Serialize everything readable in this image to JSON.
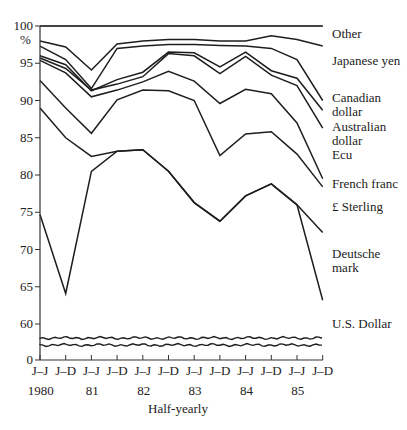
{
  "chart_data": {
    "type": "area",
    "subtype": "stacked-percentage-line",
    "title": "",
    "xlabel": "Half-yearly",
    "ylabel": "%",
    "ylim": [
      0,
      100
    ],
    "y_axis_break": {
      "from": 0,
      "to": 60
    },
    "y_ticks": [
      0,
      60,
      65,
      70,
      75,
      80,
      85,
      90,
      95,
      100
    ],
    "x_tick_labels": [
      "J–J",
      "J–D",
      "J–J",
      "J–D",
      "J–J",
      "J–D",
      "J–J",
      "J–D",
      "J–J",
      "J–D",
      "J–J",
      "J–D"
    ],
    "x_year_labels": [
      {
        "label": "1980",
        "index": 0.5
      },
      {
        "label": "81",
        "index": 2.5
      },
      {
        "label": "82",
        "index": 4.5
      },
      {
        "label": "83",
        "index": 6.5
      },
      {
        "label": "84",
        "index": 8.5
      },
      {
        "label": "85",
        "index": 10.5
      }
    ],
    "categories": [
      "1980 J–J",
      "1980 J–D",
      "1981 J–J",
      "1981 J–D",
      "1982 J–J",
      "1982 J–D",
      "1983 J–J",
      "1983 J–D",
      "1984 J–J",
      "1984 J–D",
      "1985 J–J",
      "1985 J–D"
    ],
    "legend_position": "right",
    "grid": false,
    "series_note": "Values are cumulative upper boundaries of each currency band (percent share).",
    "series": [
      {
        "name": "Other",
        "boundary": "top",
        "values": [
          100,
          100,
          100,
          100,
          100,
          100,
          100,
          100,
          100,
          100,
          100,
          100
        ]
      },
      {
        "name": "Japanese yen",
        "boundary": "top",
        "values": [
          98.0,
          97.2,
          94.1,
          97.6,
          98.0,
          98.2,
          98.2,
          98.0,
          98.0,
          98.7,
          98.2,
          97.3
        ]
      },
      {
        "name": "Canadian dollar",
        "boundary": "top",
        "values": [
          97.3,
          95.5,
          91.6,
          97.0,
          97.3,
          97.5,
          97.5,
          97.4,
          97.3,
          97.0,
          95.5,
          90.0
        ]
      },
      {
        "name": "Australian dollar",
        "boundary": "top",
        "values": [
          96.0,
          94.8,
          91.3,
          92.8,
          93.8,
          96.5,
          96.4,
          94.5,
          96.5,
          94.0,
          93.0,
          88.7
        ]
      },
      {
        "name": "Ecu",
        "boundary": "top",
        "values": [
          95.7,
          94.3,
          91.4,
          92.2,
          93.2,
          96.3,
          96.0,
          93.6,
          95.9,
          93.4,
          92.0,
          86.3
        ]
      },
      {
        "name": "French franc",
        "boundary": "top",
        "values": [
          95.4,
          93.7,
          90.5,
          91.4,
          92.5,
          93.9,
          92.6,
          89.6,
          91.5,
          90.9,
          87.0,
          79.5
        ]
      },
      {
        "name": "£ Sterling",
        "boundary": "top",
        "values": [
          92.7,
          89.0,
          85.6,
          90.1,
          91.4,
          91.3,
          90.0,
          82.6,
          85.5,
          85.8,
          82.8,
          78.4
        ]
      },
      {
        "name": "Deutsche mark",
        "boundary": "top",
        "values": [
          89.0,
          85.0,
          82.5,
          83.2,
          83.4,
          80.5,
          76.3,
          73.8,
          77.2,
          78.8,
          76.0,
          72.3
        ]
      },
      {
        "name": "U.S. Dollar",
        "boundary": "top",
        "values": [
          74.7,
          64.1,
          80.5,
          83.2,
          83.4,
          80.5,
          76.3,
          73.8,
          77.2,
          78.8,
          76.0,
          63.2
        ]
      }
    ],
    "legend": [
      "Other",
      "Japanese yen",
      "Canadian dollar",
      "Australian dollar",
      "Ecu",
      "French franc",
      "£ Sterling",
      "Deutsche mark",
      "U.S. Dollar"
    ]
  },
  "axis": {
    "y_unit": "%",
    "x_title": "Half-yearly"
  },
  "legend_labels": {
    "other": "Other",
    "yen": "Japanese yen",
    "cad_1": "Canadian",
    "cad_2": "dollar",
    "aud_1": "Australian",
    "aud_2": "dollar",
    "ecu": "Ecu",
    "ffr": "French franc",
    "gbp": "£ Sterling",
    "dm_1": "Deutsche",
    "dm_2": "mark",
    "usd": "U.S. Dollar"
  }
}
